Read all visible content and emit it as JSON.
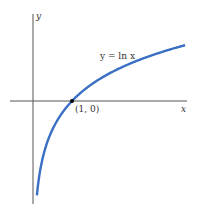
{
  "chart_data": {
    "type": "line",
    "title": "",
    "xlabel": "x",
    "ylabel": "y",
    "series": [
      {
        "name": "y = ln x",
        "function": "ln(x)",
        "color": "#3a6fc4"
      }
    ],
    "annotations": [
      {
        "text": "(1, 0)",
        "x": 1,
        "y": 0
      }
    ],
    "curve_label": "y = ln x",
    "xlim": [
      0,
      4
    ],
    "grid": false
  },
  "labels": {
    "x_axis": "x",
    "y_axis": "y",
    "point": "(1, 0)",
    "curve": "y = ln x"
  }
}
